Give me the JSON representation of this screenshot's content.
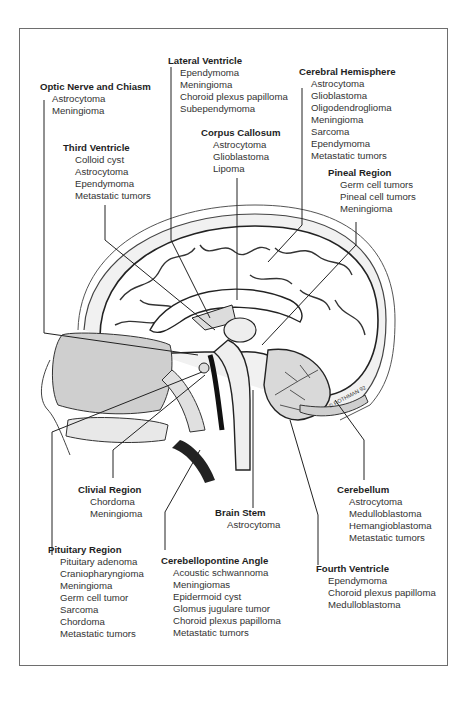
{
  "figure": {
    "signature": "© ROTHMAN 92"
  },
  "regions": [
    {
      "id": "optic",
      "title": "Optic Nerve and Chiasm",
      "items": [
        "Astrocytoma",
        "Meningioma"
      ]
    },
    {
      "id": "lateral",
      "title": "Lateral Ventricle",
      "items": [
        "Ependymoma",
        "Meningioma",
        "Choroid plexus papilloma",
        "Subependymoma"
      ]
    },
    {
      "id": "cerebral",
      "title": "Cerebral Hemisphere",
      "items": [
        "Astrocytoma",
        "Glioblastoma",
        "Oligodendroglioma",
        "Meningioma",
        "Sarcoma",
        "Ependymoma",
        "Metastatic tumors"
      ]
    },
    {
      "id": "third",
      "title": "Third Ventricle",
      "items": [
        "Colloid cyst",
        "Astrocytoma",
        "Ependymoma",
        "Metastatic tumors"
      ]
    },
    {
      "id": "corpus",
      "title": "Corpus Callosum",
      "items": [
        "Astrocytoma",
        "Glioblastoma",
        "Lipoma"
      ]
    },
    {
      "id": "pineal",
      "title": "Pineal Region",
      "items": [
        "Germ cell tumors",
        "Pineal cell tumors",
        "Meningioma"
      ]
    },
    {
      "id": "clivial",
      "title": "Clivial Region",
      "items": [
        "Chordoma",
        "Meningioma"
      ]
    },
    {
      "id": "brainstem",
      "title": "Brain Stem",
      "items": [
        "Astrocytoma"
      ]
    },
    {
      "id": "cerebellum",
      "title": "Cerebellum",
      "items": [
        "Astrocytoma",
        "Medulloblastoma",
        "Hemangioblastoma",
        "Metastatic tumors"
      ]
    },
    {
      "id": "pituitary",
      "title": "Pituitary Region",
      "items": [
        "Pituitary adenoma",
        "Craniopharyngioma",
        "Meningioma",
        "Germ cell tumor",
        "Sarcoma",
        "Chordoma",
        "Metastatic tumors"
      ]
    },
    {
      "id": "cpa",
      "title": "Cerebellopontine Angle",
      "items": [
        "Acoustic schwannoma",
        "Meningiomas",
        "Epidermoid cyst",
        "Glomus jugulare tumor",
        "Choroid plexus papilloma",
        "Metastatic tumors"
      ]
    },
    {
      "id": "fourth",
      "title": "Fourth Ventricle",
      "items": [
        "Ependymoma",
        "Choroid plexus papilloma",
        "Medulloblastoma"
      ]
    }
  ]
}
